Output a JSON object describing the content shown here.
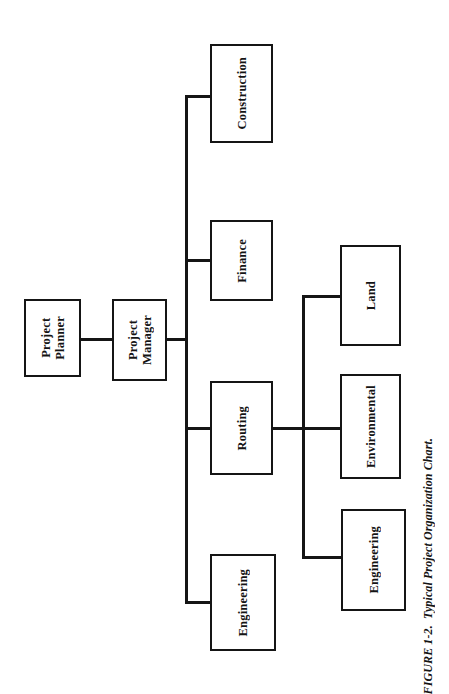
{
  "figure": {
    "caption": "FIGURE 1-2.  Typical Project Organization Chart.",
    "caption_number": "FIGURE 1-2.",
    "caption_title": "Typical Project Organization Chart."
  },
  "colors": {
    "line": "#151515",
    "box_border": "#151515",
    "box_fill": "#ffffff",
    "text": "#141414",
    "page_background": "#ffffff"
  },
  "chart_data": {
    "type": "diagram",
    "diagram_kind": "organization-chart",
    "orientation": "rotated-90-counterclockwise",
    "title": "Typical Project Organization Chart",
    "nodes": [
      {
        "id": "project-planner",
        "label": "Project\nPlanner",
        "level": 0
      },
      {
        "id": "project-manager",
        "label": "Project\nManager",
        "level": 1
      },
      {
        "id": "construction",
        "label": "Construction",
        "level": 2
      },
      {
        "id": "finance",
        "label": "Finance",
        "level": 2
      },
      {
        "id": "routing",
        "label": "Routing",
        "level": 2
      },
      {
        "id": "engineering-1",
        "label": "Engineering",
        "level": 2
      },
      {
        "id": "land",
        "label": "Land",
        "level": 3
      },
      {
        "id": "environmental",
        "label": "Environmental",
        "level": 3
      },
      {
        "id": "engineering-2",
        "label": "Engineering",
        "level": 3
      }
    ],
    "edges": [
      {
        "from": "project-planner",
        "to": "project-manager"
      },
      {
        "from": "project-manager",
        "to": "construction"
      },
      {
        "from": "project-manager",
        "to": "finance"
      },
      {
        "from": "project-manager",
        "to": "routing"
      },
      {
        "from": "project-manager",
        "to": "engineering-1"
      },
      {
        "from": "routing",
        "to": "land"
      },
      {
        "from": "routing",
        "to": "environmental"
      },
      {
        "from": "routing",
        "to": "engineering-2"
      }
    ]
  },
  "nodes": {
    "project_planner": "Project\nPlanner",
    "project_manager": "Project\nManager",
    "construction": "Construction",
    "finance": "Finance",
    "routing": "Routing",
    "engineering_1": "Engineering",
    "land": "Land",
    "environmental": "Environmental",
    "engineering_2": "Engineering"
  }
}
